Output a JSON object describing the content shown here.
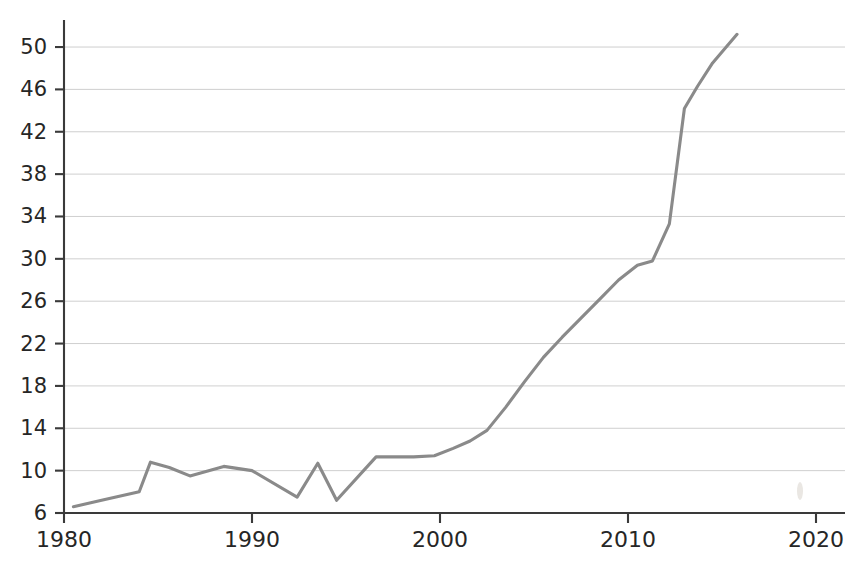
{
  "chart_data": {
    "type": "line",
    "title": "",
    "subtitle": "",
    "xlabel": "",
    "ylabel": "",
    "xlim": [
      1980,
      2020
    ],
    "ylim": [
      6,
      51.5
    ],
    "xticks": [
      1980,
      1990,
      2000,
      2010,
      2020
    ],
    "xtick_labels": [
      "1980",
      "1990",
      "2000",
      "2010",
      "2020"
    ],
    "yticks": [
      6,
      10,
      14,
      18,
      22,
      26,
      30,
      34,
      38,
      42,
      46,
      50
    ],
    "ytick_labels": [
      "6",
      "10",
      "14",
      "18",
      "22",
      "26",
      "30",
      "34",
      "38",
      "42",
      "46",
      "50"
    ],
    "grid": true,
    "grid_axis": "y",
    "legend": false,
    "legend_position": "none",
    "annotations": [],
    "series": [
      {
        "name": "series-1",
        "color": "#8a8a8a",
        "x": [
          1980.5,
          1982.0,
          1984.0,
          1984.6,
          1985.6,
          1986.7,
          1988.5,
          1990.0,
          1992.4,
          1993.5,
          1994.5,
          1996.6,
          1997.6,
          1998.6,
          1999.7,
          2000.7,
          2001.6,
          2002.5,
          2003.5,
          2004.5,
          2005.5,
          2006.5,
          2007.5,
          2008.5,
          2009.5,
          2010.5,
          2011.3,
          2012.2,
          2013.0,
          2013.7,
          2014.5,
          2015.8
        ],
        "y": [
          6.6,
          7.2,
          8.0,
          10.8,
          10.3,
          9.5,
          10.4,
          10.0,
          7.5,
          10.7,
          7.2,
          11.3,
          11.3,
          11.3,
          11.4,
          12.1,
          12.8,
          13.8,
          16.0,
          18.4,
          20.7,
          22.6,
          24.4,
          26.2,
          28.0,
          29.4,
          29.8,
          33.3,
          44.2,
          46.3,
          48.5,
          51.2
        ]
      }
    ]
  },
  "geometry": {
    "plot_left": 64,
    "plot_right": 845,
    "plot_top": 20,
    "plot_bottom": 513,
    "x_year_to_px": 18.8,
    "y_unit_to_px": 10.59
  }
}
